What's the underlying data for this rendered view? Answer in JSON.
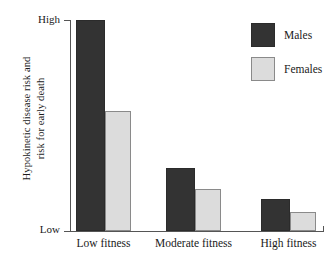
{
  "chart_data": {
    "type": "bar",
    "title": "",
    "xlabel": "",
    "ylabel": "Hypokinetic disease risk and risk for early death",
    "ylabel_line1": "Hypokinetic disease risk and",
    "ylabel_line2": "risk for early death",
    "categories": [
      "Low fitness",
      "Moderate fitness",
      "High fitness"
    ],
    "ytick_labels": [
      "Low",
      "High"
    ],
    "ylim": [
      0,
      100
    ],
    "y_axis_is_qualitative": true,
    "grid": false,
    "legend_position": "top-right",
    "series": [
      {
        "name": "Males",
        "color": "#333333",
        "border_color": "#2b2b2b",
        "values": [
          100,
          30,
          15
        ]
      },
      {
        "name": "Females",
        "color": "#dcdcdc",
        "border_color": "#8a8a8a",
        "values": [
          57,
          20,
          9
        ]
      }
    ]
  },
  "axis": {
    "high_label": "High",
    "low_label": "Low"
  },
  "legend": {
    "items": [
      {
        "label": "Males"
      },
      {
        "label": "Females"
      }
    ]
  },
  "colors": {
    "background": "#ffffff",
    "axis": "#555555",
    "text": "#1a1a1a",
    "males": "#333333",
    "females": "#dcdcdc"
  }
}
